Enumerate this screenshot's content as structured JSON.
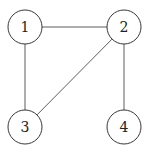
{
  "diagram": {
    "type": "undirected-graph",
    "nodes": [
      {
        "id": "1",
        "label": "1",
        "cx": 25,
        "cy": 27
      },
      {
        "id": "2",
        "label": "2",
        "cx": 124,
        "cy": 27
      },
      {
        "id": "3",
        "label": "3",
        "cx": 25,
        "cy": 127
      },
      {
        "id": "4",
        "label": "4",
        "cx": 124,
        "cy": 127
      }
    ],
    "edges": [
      {
        "from": "1",
        "to": "2"
      },
      {
        "from": "1",
        "to": "3"
      },
      {
        "from": "2",
        "to": "3"
      },
      {
        "from": "2",
        "to": "4"
      }
    ],
    "node_radius": 17
  }
}
